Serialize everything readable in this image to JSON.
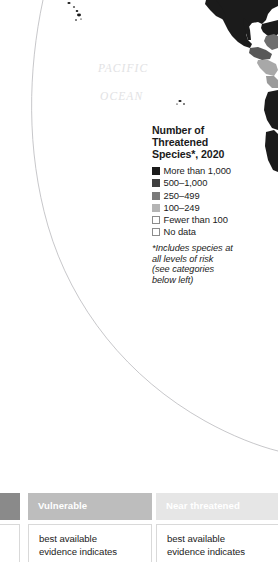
{
  "map": {
    "ocean_label_line1": "PACIFIC",
    "ocean_label_line2": "OCEAN",
    "ocean_label_color": "#e2e2e4",
    "background_color": "#ffffff",
    "graticule_color": "#b9b9bd",
    "landmass_colors": {
      "more_than_1000": "#1b1b1b",
      "500_1000": "#3f3f3f",
      "250_499": "#7a7a7a",
      "100_249": "#b4b4b4",
      "fewer_than_100": "#ffffff",
      "no_data": "#ffffff"
    }
  },
  "legend": {
    "title": "Number of\nThreatened\nSpecies*, 2020",
    "items": [
      {
        "label": "More than 1,000",
        "color": "#1b1b1b",
        "border": "#1b1b1b"
      },
      {
        "label": "500–1,000",
        "color": "#3f3f3f",
        "border": "#3f3f3f"
      },
      {
        "label": "250–499",
        "color": "#7a7a7a",
        "border": "#7a7a7a"
      },
      {
        "label": "100–249",
        "color": "#b4b4b4",
        "border": "#b4b4b4"
      },
      {
        "label": "Fewer than 100",
        "color": "#ffffff",
        "border": "#8c8c8c"
      },
      {
        "label": "No data",
        "color": "#ffffff",
        "border": "#8c8c8c"
      }
    ],
    "note": "*Includes species at\n all levels of risk\n (see categories\n below left)"
  },
  "status_table": {
    "columns": [
      {
        "header": "",
        "header_bg": "#8a8a8a",
        "body": "s"
      },
      {
        "header": "Vulnerable",
        "header_bg": "#bdbdbd",
        "body": "best available\nevidence indicates"
      },
      {
        "header": "Near threatened",
        "header_bg": "#e6e6e6",
        "body": "best available\nevidence indicates"
      }
    ]
  }
}
